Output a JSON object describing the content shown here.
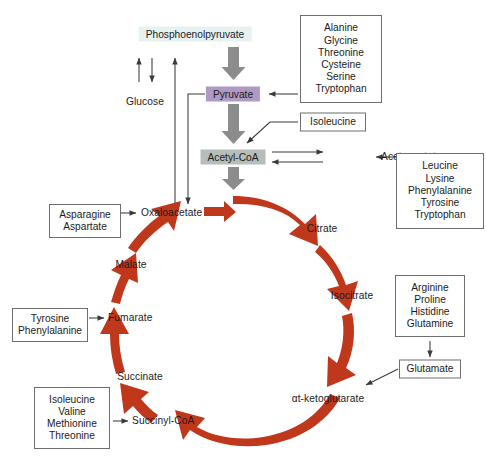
{
  "diagram": {
    "colors": {
      "cycle_arrow": "#c0381c",
      "glycolysis_arrow": "#8c8c8c",
      "thin_arrow": "#3a3a3a",
      "pep_box": "#e8f1f2",
      "pyruvate_box": "#b09ac4",
      "acetyl_coa_box": "#b7bdb7",
      "box_border": "#6e6e6e",
      "text": "#1b1b1b",
      "background": "#ffffff"
    }
  },
  "metabolites": {
    "phosphoenolpyruvate": "Phosphoenolpyruvate",
    "glucose": "Glucose",
    "pyruvate": "Pyruvate",
    "acetyl_coa": "Acetyl-CoA",
    "acetoacetate": "Acetoacetate",
    "oxaloacetate": "Oxaloacetate",
    "citrate": "Citrate",
    "isocitrate": "Isocitrate",
    "alpha_ketoglutarate": "αt-ketoglutarate",
    "succinyl_coa": "Succinyl-CoA",
    "succinate": "Succinate",
    "fumarate": "Fumarate",
    "malate": "Malate",
    "glutamate": "Glutamate"
  },
  "amino_acid_groups": {
    "to_pyruvate": {
      "name": "pyruvate-precursors",
      "items": [
        "Alanine",
        "Glycine",
        "Threonine",
        "Cysteine",
        "Serine",
        "Tryptophan"
      ]
    },
    "to_acetyl_coa": {
      "name": "acetyl-coa-precursors",
      "items": [
        "Isoleucine"
      ]
    },
    "to_acetoacetate": {
      "name": "acetoacetate-precursors",
      "items": [
        "Leucine",
        "Lysine",
        "Phenylalanine",
        "Tyrosine",
        "Tryptophan"
      ]
    },
    "to_oxaloacetate": {
      "name": "oxaloacetate-precursors",
      "items": [
        "Asparagine",
        "Aspartate"
      ]
    },
    "to_fumarate": {
      "name": "fumarate-precursors",
      "items": [
        "Tyrosine",
        "Phenylalanine"
      ]
    },
    "to_succinyl_coa": {
      "name": "succinyl-coa-precursors",
      "items": [
        "Isoleucine",
        "Valine",
        "Methionine",
        "Threonine"
      ]
    },
    "to_glutamate": {
      "name": "glutamate-precursors",
      "items": [
        "Arginine",
        "Proline",
        "Histidine",
        "Glutamine"
      ]
    }
  },
  "cycle_order": [
    "Oxaloacetate",
    "Citrate",
    "Isocitrate",
    "αt-ketoglutarate",
    "Succinyl-CoA",
    "Succinate",
    "Fumarate",
    "Malate"
  ]
}
